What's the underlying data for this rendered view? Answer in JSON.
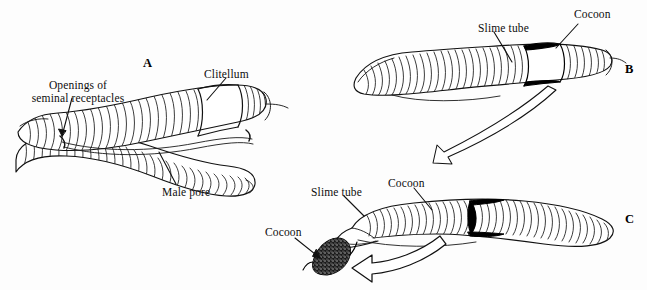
{
  "figure": {
    "background_color": "#fdfdfd",
    "ink_color": "#0d0d0d"
  },
  "panels": [
    {
      "letter": "A",
      "caption": "Two earthworms copulating, joined ventrally at the clitellum",
      "labels": [
        {
          "id": "openings",
          "line1": "Openings of",
          "line2": "seminal receptacles"
        },
        {
          "id": "clitellum",
          "text": "Clitellum"
        },
        {
          "id": "male_pore",
          "text": "Male pore"
        }
      ]
    },
    {
      "letter": "B",
      "caption": "Slime tube and cocoon formed on the clitellum",
      "labels": [
        {
          "id": "slime_tube_b",
          "text": "Slime tube"
        },
        {
          "id": "cocoon_b",
          "text": "Cocoon"
        }
      ]
    },
    {
      "letter": "C",
      "caption": "Worm backing out; cocoon slips off and seals",
      "labels": [
        {
          "id": "slime_tube_c",
          "text": "Slime tube"
        },
        {
          "id": "cocoon_c_band",
          "text": "Cocoon"
        },
        {
          "id": "cocoon_c_free",
          "text": "Cocoon"
        }
      ]
    }
  ]
}
